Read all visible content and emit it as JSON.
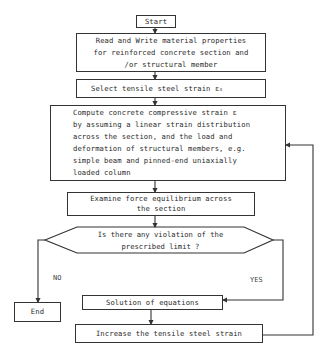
{
  "flowchart": {
    "start": "Start",
    "read_write": "Read and Write material properties\nfor reinforced concrete section and\n/or structural member",
    "select_strain": "Select tensile steel strain ε",
    "select_strain_sub": "s",
    "compute": "Compute concrete compressive strain ε\nby assuming a linear strain distribution\nacross the section, and the load and\ndeformation of structural members, e.g.\nsimple beam and pinned-end uniaxially\nloaded column",
    "compute_sub": "c",
    "examine": "Examine force equilibrium across\nthe section",
    "decision": "Is there any violation of the\nprescribed limit ?",
    "no_label": "NO",
    "yes_label": "YES",
    "end": "End",
    "solution": "Solution of equations",
    "increase": "Increase the tensile steel strain"
  },
  "colors": {
    "line": "#333333",
    "text": "#2a2a2a",
    "background": "#ffffff"
  }
}
